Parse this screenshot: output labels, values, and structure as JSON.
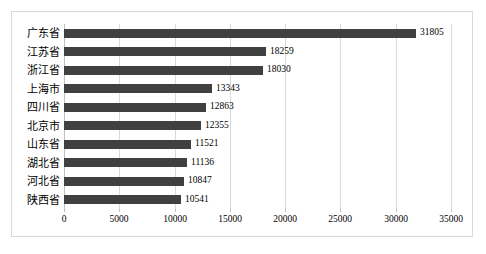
{
  "chart_data": {
    "type": "bar",
    "orientation": "horizontal",
    "title": "",
    "subtitle": "",
    "xlabel": "",
    "ylabel": "",
    "categories": [
      "广东省",
      "江苏省",
      "浙江省",
      "上海市",
      "四川省",
      "北京市",
      "山东省",
      "湖北省",
      "河北省",
      "陕西省"
    ],
    "values": [
      31805,
      18259,
      18030,
      13343,
      12863,
      12355,
      11521,
      11136,
      10847,
      10541
    ],
    "data_labels": [
      "31805",
      "18259",
      "18030",
      "13343",
      "12863",
      "12355",
      "11521",
      "11136",
      "10847",
      "10541"
    ],
    "xlim": [
      0,
      35000
    ],
    "xticks": [
      0,
      5000,
      10000,
      15000,
      20000,
      25000,
      30000,
      35000
    ],
    "xtick_labels": [
      "0",
      "5000",
      "10000",
      "15000",
      "20000",
      "25000",
      "30000",
      "35000"
    ],
    "grid": "vertical",
    "legend": "none",
    "bar_color": "#404040",
    "gridline_color": "#d9d9d9",
    "border_color": "#d9d9d9",
    "background_color": "#ffffff",
    "label_color": "#000000"
  }
}
